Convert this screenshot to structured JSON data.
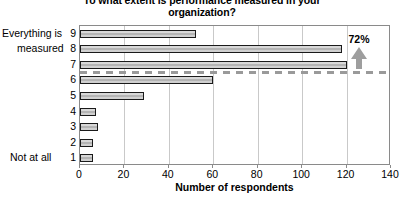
{
  "chart_data": {
    "type": "bar",
    "orientation": "horizontal",
    "title": "To what extent is performance measured in your organization?",
    "xlabel": "Number of respondents",
    "ylabel": "",
    "categories": [
      "9",
      "8",
      "7",
      "6",
      "5",
      "4",
      "3",
      "2",
      "1"
    ],
    "values": [
      52,
      118,
      120,
      60,
      29,
      7,
      8,
      6,
      6
    ],
    "xlim": [
      0,
      140
    ],
    "xticks": [
      0,
      20,
      40,
      60,
      80,
      100,
      120,
      140
    ],
    "grid": true,
    "grid_axis": "x",
    "legend": "none",
    "scale_anchor_top": "Everything is measured",
    "scale_anchor_bottom": "Not at all",
    "annotations": [
      {
        "label": "72%",
        "icon": "up-arrow-icon",
        "description": "dashed reference line between categories 7 and 6 with upward arrow",
        "reference_line_between": [
          "7",
          "6"
        ]
      }
    ],
    "colors": {
      "bar_fill": "#c6c6c6",
      "bar_border": "#1a1a1a",
      "gridline": "#c9c9c9",
      "frame": "#8a8a8a",
      "dashed_line": "#9a9a9a",
      "arrow": "#9e9e9e",
      "text": "#000000"
    }
  },
  "axis": {
    "y_top_label_line1": "Everything is",
    "y_top_label_line2": "measured",
    "y_bottom_label": "Not at all"
  }
}
